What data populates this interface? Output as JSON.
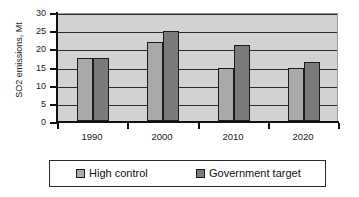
{
  "chart_data": {
    "type": "bar",
    "title": "",
    "xlabel": "",
    "ylabel": "SO2 emissions, Mt",
    "categories": [
      "1990",
      "2000",
      "2010",
      "2020"
    ],
    "series": [
      {
        "name": "High control",
        "color": "#a9a9a9",
        "values": [
          17.3,
          21.8,
          14.5,
          14.7
        ]
      },
      {
        "name": "Government target",
        "color": "#7a7a7a",
        "values": [
          17.3,
          24.8,
          20.8,
          16.3
        ]
      }
    ],
    "ylim": [
      0,
      30
    ],
    "ytick_labels": [
      "30",
      "25",
      "20",
      "15",
      "10",
      "5",
      "0"
    ],
    "ytick_values": [
      30,
      25,
      20,
      15,
      10,
      5,
      0
    ],
    "grid": true,
    "legend_position": "bottom",
    "plot_background": "#d2d2d2"
  }
}
